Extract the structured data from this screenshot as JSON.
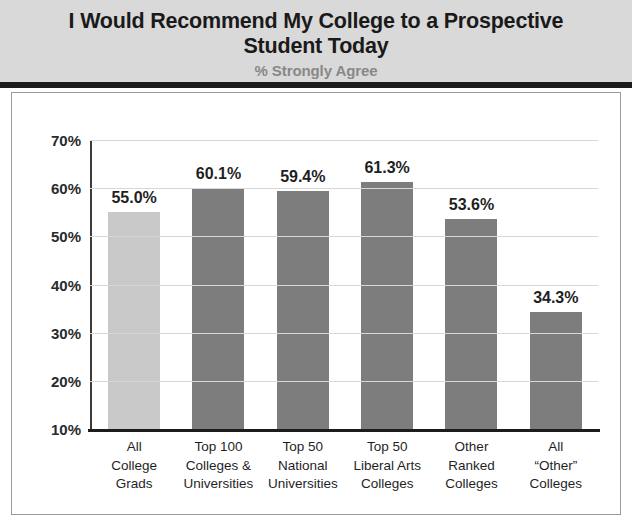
{
  "header": {
    "title": "I Would Recommend My College to a Prospective Student Today",
    "title_line1": "I Would Recommend My College to a",
    "title_line2": "Prospective Student Today",
    "subtitle": "% Strongly Agree"
  },
  "colors": {
    "header_background": "#d9d9d9",
    "header_rule": "#1c1c1c",
    "bar_default": "#7d7d7d",
    "bar_highlight": "#c9c9c9",
    "gridline": "#d7d7d7",
    "axis": "#1c1c1c",
    "title_text": "#1a1a1a",
    "subtitle_text": "#888888"
  },
  "chart_data": {
    "type": "bar",
    "title": "I Would Recommend My College to a Prospective Student Today",
    "subtitle": "% Strongly Agree",
    "xlabel": "",
    "ylabel": "",
    "ylim": [
      10,
      70
    ],
    "ytick_values": [
      10,
      20,
      30,
      40,
      50,
      60,
      70
    ],
    "ytick_labels": [
      "10%",
      "20%",
      "30%",
      "40%",
      "50%",
      "60%",
      "70%"
    ],
    "grid": true,
    "legend": false,
    "categories": [
      "All College Grads",
      "Top 100 Colleges & Universities",
      "Top 50 National Universities",
      "Top 50 Liberal Arts Colleges",
      "Other Ranked Colleges",
      "All “Other” Colleges"
    ],
    "category_lines": [
      [
        "All",
        "College",
        "Grads"
      ],
      [
        "Top 100",
        "Colleges &",
        "Universities"
      ],
      [
        "Top 50",
        "National",
        "Universities"
      ],
      [
        "Top 50",
        "Liberal Arts",
        "Colleges"
      ],
      [
        "Other",
        "Ranked",
        "Colleges"
      ],
      [
        "All",
        "“Other”",
        "Colleges"
      ]
    ],
    "values": [
      55.0,
      60.1,
      59.4,
      61.3,
      53.6,
      34.3
    ],
    "value_labels": [
      "55.0%",
      "60.1%",
      "59.4%",
      "61.3%",
      "53.6%",
      "34.3%"
    ],
    "bar_colors": [
      "#c9c9c9",
      "#7d7d7d",
      "#7d7d7d",
      "#7d7d7d",
      "#7d7d7d",
      "#7d7d7d"
    ]
  }
}
